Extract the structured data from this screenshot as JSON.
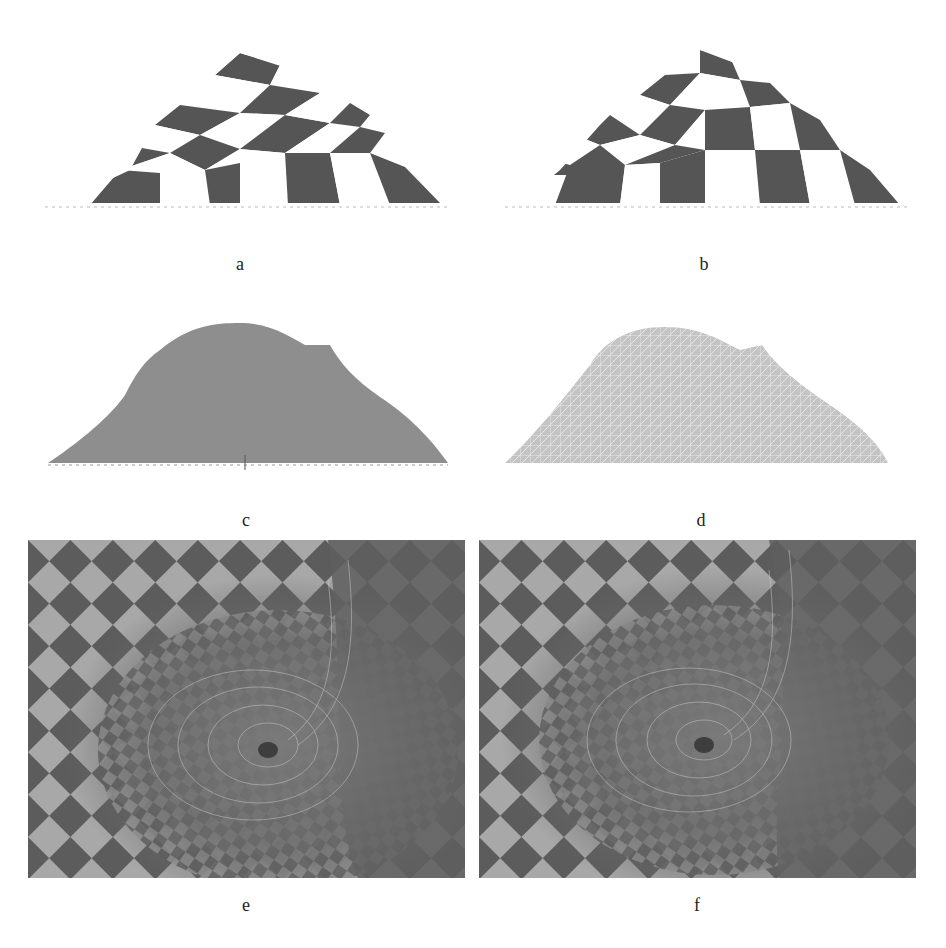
{
  "figure": {
    "panels": [
      {
        "id": "a",
        "label": "a",
        "content": "checkerboard-textured dome surface (front view)"
      },
      {
        "id": "b",
        "label": "b",
        "content": "checkerboard-textured dome surface (front view, alternative mapping)"
      },
      {
        "id": "c",
        "label": "c",
        "content": "shaded gray dome surface"
      },
      {
        "id": "d",
        "label": "d",
        "content": "dense wireframe mesh dome surface"
      },
      {
        "id": "e",
        "label": "e",
        "content": "close-up of swirled checkerboard texture with vortex distortion"
      },
      {
        "id": "f",
        "label": "f",
        "content": "close-up of swirled checkerboard texture with vortex distortion (alternative)"
      }
    ],
    "colors": {
      "background": "#ffffff",
      "checker_dark": "#555555",
      "checker_light": "#ffffff",
      "shaded_surface": "#8e8e8e",
      "wire_surface": "#c4c4c4",
      "closeup_dark": "#5c5c5c",
      "closeup_light": "#a8a8a8"
    }
  }
}
